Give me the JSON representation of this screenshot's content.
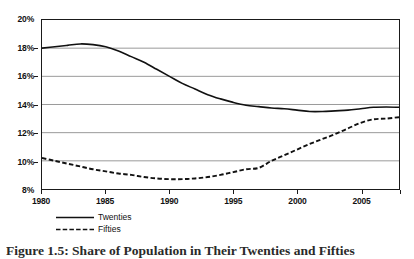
{
  "chart_data": {
    "type": "line",
    "title": "",
    "xlabel": "",
    "ylabel": "",
    "xlim": [
      1980,
      2008
    ],
    "ylim": [
      8,
      20
    ],
    "ytick_values": [
      8,
      10,
      12,
      14,
      16,
      18,
      20
    ],
    "ytick_labels": [
      "8%",
      "10%",
      "12%",
      "14%",
      "16%",
      "18%",
      "20%"
    ],
    "xtick_values": [
      1980,
      1985,
      1990,
      1995,
      2000,
      2005
    ],
    "xtick_labels": [
      "1980",
      "1985",
      "1990",
      "1995",
      "2000",
      "2005"
    ],
    "xtick_minor_values": [
      1980,
      1985,
      1990,
      1995,
      2000,
      2005,
      2008
    ],
    "grid": "horizontal",
    "legend_position": "below-axis-left",
    "x": [
      1980,
      1981,
      1982,
      1983,
      1984,
      1985,
      1986,
      1987,
      1988,
      1989,
      1990,
      1991,
      1992,
      1993,
      1994,
      1995,
      1996,
      1997,
      1998,
      1999,
      2000,
      2001,
      2002,
      2003,
      2004,
      2005,
      2006,
      2007,
      2008
    ],
    "series": [
      {
        "name": "Twenties",
        "style": "solid",
        "color": "#111111",
        "values": [
          18.0,
          18.1,
          18.2,
          18.3,
          18.25,
          18.1,
          17.8,
          17.4,
          17.0,
          16.5,
          16.0,
          15.5,
          15.1,
          14.7,
          14.4,
          14.15,
          13.95,
          13.85,
          13.75,
          13.7,
          13.6,
          13.5,
          13.5,
          13.55,
          13.6,
          13.7,
          13.8,
          13.82,
          13.8
        ]
      },
      {
        "name": "Fifties",
        "style": "dashed",
        "color": "#111111",
        "values": [
          10.2,
          10.0,
          9.8,
          9.6,
          9.4,
          9.25,
          9.1,
          9.0,
          8.85,
          8.75,
          8.7,
          8.7,
          8.75,
          8.85,
          9.0,
          9.2,
          9.4,
          9.5,
          10.0,
          10.4,
          10.8,
          11.2,
          11.55,
          11.9,
          12.3,
          12.7,
          12.95,
          13.0,
          13.1
        ]
      }
    ]
  },
  "legend": {
    "items": [
      {
        "label": "Twenties",
        "style": "solid"
      },
      {
        "label": "Fifties",
        "style": "dashed"
      }
    ]
  },
  "caption": {
    "text": "Figure 1.5: Share of Population in Their Twenties and Fifties"
  }
}
